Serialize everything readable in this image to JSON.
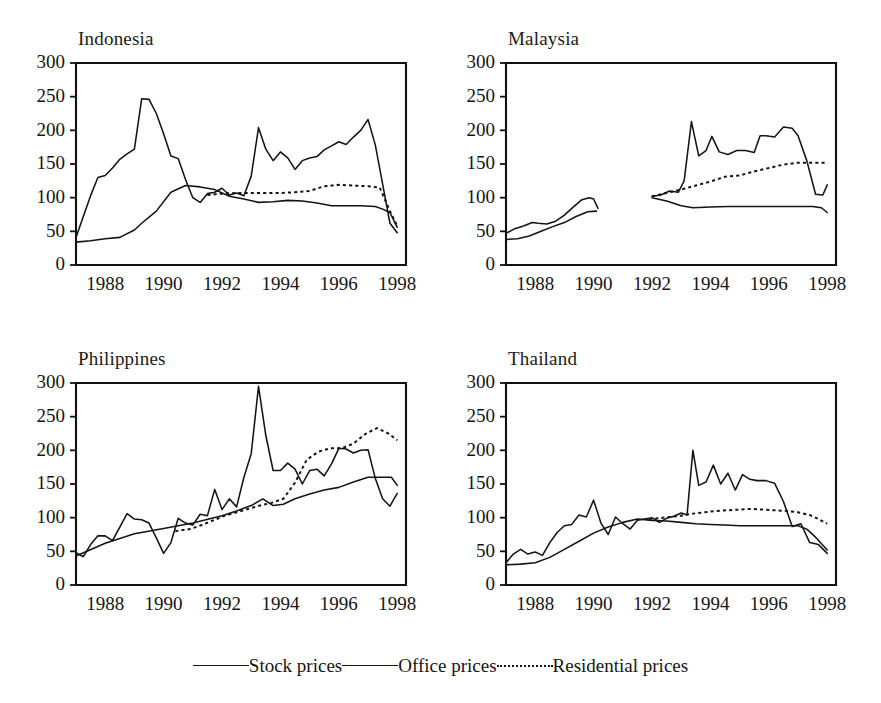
{
  "figure": {
    "background": "#ffffff",
    "ink_color": "#141414",
    "panel_count": 4,
    "layout": "2x2 grid of line charts with shared bottom legend"
  },
  "legend": {
    "position": "bottom-center",
    "entries": [
      {
        "label": "Stock prices",
        "style": "solid",
        "swatch": "solid-line-swatch"
      },
      {
        "label": "Office prices",
        "style": "solid",
        "swatch": "solid-line-swatch"
      },
      {
        "label": "Residential prices",
        "style": "dotted",
        "swatch": "dotted-line-swatch"
      }
    ]
  },
  "chart_data": [
    {
      "type": "line",
      "title": "Indonesia",
      "xlabel": "",
      "ylabel": "",
      "xlim": [
        1987.0,
        1998.3
      ],
      "ylim": [
        0,
        300
      ],
      "ytick_values": [
        0,
        50,
        100,
        150,
        200,
        250,
        300
      ],
      "ytick_labels": [
        "0",
        "50",
        "100",
        "150",
        "200",
        "250",
        "300"
      ],
      "xtick_values": [
        1988,
        1990,
        1992,
        1994,
        1996,
        1998
      ],
      "xtick_labels": [
        "1988",
        "1990",
        "1992",
        "1994",
        "1996",
        "1998"
      ],
      "grid": false,
      "legend_position": "figure-bottom",
      "series": [
        {
          "name": "Stock prices",
          "style": "solid",
          "x": [
            1987.0,
            1987.25,
            1987.5,
            1987.75,
            1988.0,
            1988.25,
            1988.5,
            1988.75,
            1989.0,
            1989.25,
            1989.5,
            1989.75,
            1990.0,
            1990.25,
            1990.5,
            1990.75,
            1991.0,
            1991.25,
            1991.5,
            1991.75,
            1992.0,
            1992.25,
            1992.5,
            1992.75,
            1993.0,
            1993.25,
            1993.5,
            1993.75,
            1994.0,
            1994.25,
            1994.5,
            1994.75,
            1995.0,
            1995.25,
            1995.5,
            1995.75,
            1996.0,
            1996.25,
            1996.5,
            1996.75,
            1997.0,
            1997.25,
            1997.5,
            1997.75,
            1998.0
          ],
          "values": [
            41,
            72,
            103,
            130,
            133,
            144,
            157,
            165,
            172,
            247,
            246,
            225,
            195,
            162,
            158,
            127,
            100,
            93,
            106,
            108,
            114,
            104,
            107,
            103,
            132,
            204,
            172,
            155,
            168,
            159,
            142,
            155,
            159,
            161,
            171,
            177,
            183,
            179,
            190,
            200,
            216,
            178,
            120,
            62,
            48
          ]
        },
        {
          "name": "Office prices",
          "style": "solid",
          "x": [
            1987.0,
            1987.5,
            1988.0,
            1988.5,
            1989.0,
            1989.25,
            1989.75,
            1990.25,
            1990.75,
            1991.25,
            1991.75,
            1992.25,
            1992.75,
            1993.25,
            1993.75,
            1994.25,
            1994.75,
            1995.25,
            1995.75,
            1996.25,
            1996.75,
            1997.25,
            1997.5,
            1997.75,
            1998.0
          ],
          "values": [
            34,
            36,
            39,
            41,
            52,
            62,
            80,
            108,
            118,
            116,
            112,
            102,
            98,
            93,
            94,
            96,
            95,
            92,
            88,
            88,
            88,
            87,
            83,
            78,
            56
          ]
        },
        {
          "name": "Residential prices",
          "style": "dotted",
          "x": [
            1991.5,
            1992.0,
            1992.5,
            1993.0,
            1993.5,
            1994.0,
            1994.5,
            1995.0,
            1995.5,
            1996.0,
            1996.5,
            1997.0,
            1997.4,
            1997.75,
            1998.0
          ],
          "values": [
            104,
            106,
            107,
            107,
            107,
            107,
            108,
            110,
            117,
            119,
            118,
            117,
            115,
            80,
            58
          ]
        }
      ]
    },
    {
      "type": "line",
      "title": "Malaysia",
      "xlabel": "",
      "ylabel": "",
      "xlim": [
        1987.0,
        1998.3
      ],
      "ylim": [
        0,
        300
      ],
      "ytick_values": [
        0,
        50,
        100,
        150,
        200,
        250,
        300
      ],
      "ytick_labels": [
        "0",
        "50",
        "100",
        "150",
        "200",
        "250",
        "300"
      ],
      "xtick_values": [
        1988,
        1990,
        1992,
        1994,
        1996,
        1998
      ],
      "xtick_labels": [
        "1988",
        "1990",
        "1992",
        "1994",
        "1996",
        "1998"
      ],
      "grid": false,
      "legend_position": "figure-bottom",
      "note": "Data gap between 1990 and 1992",
      "series": [
        {
          "name": "Stock prices",
          "style": "solid",
          "x": [
            1987.0,
            1987.3,
            1987.6,
            1987.9,
            1988.1,
            1988.4,
            1988.7,
            1989.0,
            1989.3,
            1989.6,
            1989.85,
            1990.0,
            1990.15
          ],
          "values": [
            47,
            54,
            58,
            63,
            62,
            61,
            65,
            74,
            86,
            97,
            100,
            98,
            84
          ]
        },
        {
          "name": "Stock prices (second segment)",
          "style": "solid",
          "x": [
            1992.0,
            1992.3,
            1992.6,
            1992.9,
            1993.1,
            1993.35,
            1993.6,
            1993.85,
            1994.05,
            1994.3,
            1994.6,
            1994.9,
            1995.2,
            1995.5,
            1995.7,
            1995.9,
            1996.2,
            1996.5,
            1996.8,
            1997.0,
            1997.3,
            1997.6,
            1997.85,
            1998.0
          ],
          "values": [
            102,
            104,
            110,
            108,
            125,
            213,
            162,
            170,
            191,
            168,
            164,
            170,
            170,
            167,
            192,
            192,
            190,
            205,
            203,
            192,
            155,
            105,
            104,
            119
          ]
        },
        {
          "name": "Office prices",
          "style": "solid",
          "x": [
            1987.0,
            1987.4,
            1987.8,
            1988.2,
            1988.6,
            1989.0,
            1989.4,
            1989.8,
            1990.1
          ],
          "values": [
            38,
            39,
            43,
            50,
            57,
            63,
            72,
            79,
            80
          ]
        },
        {
          "name": "Office prices (second segment)",
          "style": "solid",
          "x": [
            1992.0,
            1992.5,
            1993.0,
            1993.4,
            1994.0,
            1994.6,
            1995.2,
            1995.8,
            1996.4,
            1997.0,
            1997.5,
            1997.8,
            1998.0
          ],
          "values": [
            100,
            95,
            88,
            85,
            86,
            87,
            87,
            87,
            87,
            87,
            87,
            85,
            78
          ]
        },
        {
          "name": "Residential prices",
          "style": "dotted",
          "x": [
            1992.0,
            1992.5,
            1993.0,
            1993.5,
            1994.0,
            1994.5,
            1995.0,
            1995.5,
            1996.0,
            1996.5,
            1997.0,
            1997.5,
            1998.0
          ],
          "values": [
            102,
            107,
            112,
            118,
            124,
            131,
            133,
            139,
            144,
            149,
            152,
            152,
            152
          ]
        }
      ]
    },
    {
      "type": "line",
      "title": "Philippines",
      "xlabel": "",
      "ylabel": "",
      "xlim": [
        1987.0,
        1998.3
      ],
      "ylim": [
        0,
        300
      ],
      "ytick_values": [
        0,
        50,
        100,
        150,
        200,
        250,
        300
      ],
      "ytick_labels": [
        "0",
        "50",
        "100",
        "150",
        "200",
        "250",
        "300"
      ],
      "xtick_values": [
        1988,
        1990,
        1992,
        1994,
        1996,
        1998
      ],
      "xtick_labels": [
        "1988",
        "1990",
        "1992",
        "1994",
        "1996",
        "1998"
      ],
      "grid": false,
      "legend_position": "figure-bottom",
      "series": [
        {
          "name": "Stock prices",
          "style": "solid",
          "x": [
            1987.0,
            1987.25,
            1987.5,
            1987.75,
            1988.0,
            1988.25,
            1988.5,
            1988.75,
            1989.0,
            1989.25,
            1989.5,
            1989.75,
            1990.0,
            1990.25,
            1990.5,
            1990.75,
            1991.0,
            1991.25,
            1991.5,
            1991.75,
            1992.0,
            1992.25,
            1992.5,
            1992.75,
            1993.0,
            1993.25,
            1993.5,
            1993.75,
            1994.0,
            1994.25,
            1994.5,
            1994.75,
            1995.0,
            1995.25,
            1995.5,
            1995.75,
            1996.0,
            1996.25,
            1996.5,
            1996.75,
            1997.0,
            1997.25,
            1997.5,
            1997.75,
            1998.0
          ],
          "values": [
            48,
            42,
            60,
            73,
            73,
            66,
            86,
            106,
            98,
            97,
            92,
            70,
            47,
            63,
            99,
            92,
            89,
            105,
            103,
            142,
            112,
            128,
            116,
            160,
            195,
            295,
            222,
            170,
            170,
            181,
            172,
            150,
            170,
            172,
            162,
            180,
            203,
            202,
            196,
            200,
            201,
            158,
            128,
            117,
            136
          ]
        },
        {
          "name": "Office prices",
          "style": "solid",
          "x": [
            1987.0,
            1988.0,
            1989.0,
            1990.0,
            1991.0,
            1992.0,
            1992.5,
            1993.0,
            1993.4,
            1993.75,
            1994.1,
            1994.5,
            1995.0,
            1995.5,
            1996.0,
            1996.5,
            1997.0,
            1997.4,
            1997.8,
            1998.0
          ],
          "values": [
            43,
            62,
            76,
            84,
            92,
            103,
            110,
            118,
            128,
            118,
            120,
            128,
            135,
            141,
            145,
            153,
            160,
            160,
            160,
            148
          ]
        },
        {
          "name": "Residential prices",
          "style": "dotted",
          "x": [
            1990.4,
            1990.9,
            1991.3,
            1991.7,
            1992.1,
            1992.5,
            1992.9,
            1993.3,
            1993.7,
            1994.1,
            1994.5,
            1994.9,
            1995.3,
            1995.7,
            1996.1,
            1996.5,
            1996.9,
            1997.3,
            1997.7,
            1998.0
          ],
          "values": [
            80,
            83,
            89,
            96,
            103,
            108,
            113,
            118,
            122,
            128,
            152,
            186,
            198,
            203,
            203,
            210,
            224,
            233,
            225,
            215
          ]
        }
      ]
    },
    {
      "type": "line",
      "title": "Thailand",
      "xlabel": "",
      "ylabel": "",
      "xlim": [
        1987.0,
        1998.3
      ],
      "ylim": [
        0,
        300
      ],
      "ytick_values": [
        0,
        50,
        100,
        150,
        200,
        250,
        300
      ],
      "ytick_labels": [
        "0",
        "50",
        "100",
        "150",
        "200",
        "250",
        "300"
      ],
      "xtick_values": [
        1988,
        1990,
        1992,
        1994,
        1996,
        1998
      ],
      "xtick_labels": [
        "1988",
        "1990",
        "1992",
        "1994",
        "1996",
        "1998"
      ],
      "grid": false,
      "legend_position": "figure-bottom",
      "series": [
        {
          "name": "Stock prices",
          "style": "solid",
          "x": [
            1987.0,
            1987.25,
            1987.5,
            1987.75,
            1988.0,
            1988.25,
            1988.5,
            1988.75,
            1989.0,
            1989.25,
            1989.5,
            1989.75,
            1990.0,
            1990.25,
            1990.5,
            1990.75,
            1991.0,
            1991.25,
            1991.5,
            1991.75,
            1992.0,
            1992.25,
            1992.5,
            1992.75,
            1993.0,
            1993.2,
            1993.4,
            1993.6,
            1993.85,
            1994.1,
            1994.35,
            1994.6,
            1994.85,
            1995.1,
            1995.35,
            1995.6,
            1995.9,
            1996.2,
            1996.5,
            1996.8,
            1997.1,
            1997.4,
            1997.7,
            1998.0
          ],
          "values": [
            33,
            46,
            53,
            46,
            49,
            44,
            63,
            78,
            88,
            90,
            104,
            101,
            126,
            92,
            75,
            101,
            91,
            83,
            96,
            98,
            100,
            93,
            99,
            102,
            107,
            104,
            200,
            148,
            153,
            178,
            150,
            166,
            141,
            164,
            157,
            155,
            155,
            151,
            124,
            87,
            91,
            63,
            60,
            47
          ]
        },
        {
          "name": "Office prices",
          "style": "solid",
          "x": [
            1987.0,
            1987.5,
            1988.0,
            1988.5,
            1989.0,
            1989.5,
            1990.0,
            1990.5,
            1991.0,
            1991.5,
            1992.0,
            1992.5,
            1993.0,
            1993.5,
            1994.0,
            1994.5,
            1995.0,
            1995.5,
            1996.0,
            1996.5,
            1997.0,
            1997.3,
            1997.6,
            1998.0
          ],
          "values": [
            30,
            31,
            33,
            41,
            53,
            65,
            77,
            86,
            93,
            98,
            96,
            95,
            93,
            91,
            90,
            89,
            88,
            88,
            88,
            88,
            88,
            83,
            71,
            52
          ]
        },
        {
          "name": "Residential prices",
          "style": "dotted",
          "x": [
            1991.9,
            1992.2,
            1992.6,
            1993.0,
            1993.4,
            1993.8,
            1994.2,
            1994.6,
            1995.0,
            1995.4,
            1995.8,
            1996.2,
            1996.6,
            1997.0,
            1997.4,
            1997.7,
            1998.0
          ],
          "values": [
            97,
            99,
            101,
            103,
            106,
            108,
            110,
            111,
            112,
            113,
            112,
            111,
            110,
            108,
            104,
            98,
            91
          ]
        }
      ]
    }
  ]
}
